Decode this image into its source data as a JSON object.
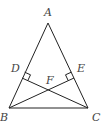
{
  "diagram": {
    "type": "geometry-triangle",
    "points": {
      "A": {
        "label": "A",
        "x": 48,
        "y": 23
      },
      "B": {
        "label": "B",
        "x": 9,
        "y": 108
      },
      "C": {
        "label": "C",
        "x": 88,
        "y": 108
      },
      "D": {
        "label": "D",
        "x": 22,
        "y": 78
      },
      "E": {
        "label": "E",
        "x": 74,
        "y": 78
      },
      "F": {
        "label": "F",
        "x": 49,
        "y": 88
      }
    },
    "segments": [
      "AB",
      "AC",
      "BC",
      "BE",
      "CD"
    ],
    "right_angles": [
      "D",
      "E"
    ],
    "line_color": "#222222",
    "label_color": "#444444"
  }
}
